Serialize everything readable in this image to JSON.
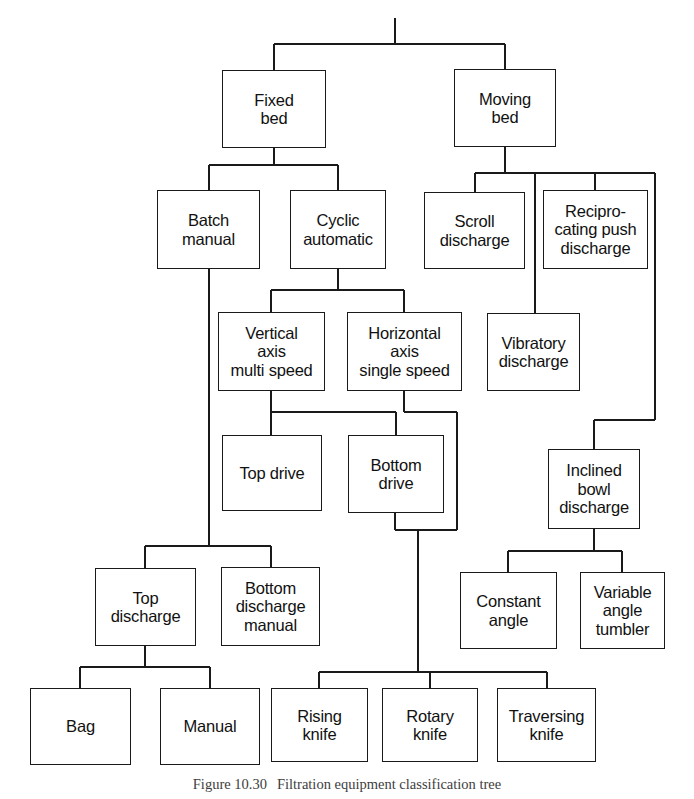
{
  "figure": {
    "type": "classification-tree-diagram",
    "title": "Filtration equipment classification tree",
    "caption_number": "Figure 10.30",
    "caption_text": "Filtration equipment classification tree",
    "background_color": "#ffffff",
    "line_color": "#1a1a1a",
    "box_border_color": "#1a1a1a",
    "box_fill_color": "#ffffff",
    "text_color": "#111111"
  },
  "nodes": [
    {
      "id": "fixed-bed",
      "label": "Fixed\nbed",
      "level": 1,
      "x": 222,
      "y": 70,
      "w": 104,
      "h": 78
    },
    {
      "id": "moving-bed",
      "label": "Moving\nbed",
      "level": 1,
      "x": 454,
      "y": 69,
      "w": 102,
      "h": 78
    },
    {
      "id": "batch-manual",
      "label": "Batch\nmanual",
      "level": 2,
      "x": 157,
      "y": 190,
      "w": 103,
      "h": 79
    },
    {
      "id": "cyclic-automatic",
      "label": "Cyclic\nautomatic",
      "level": 2,
      "x": 290,
      "y": 190,
      "w": 96,
      "h": 79
    },
    {
      "id": "scroll-discharge",
      "label": "Scroll\ndischarge",
      "level": 2,
      "x": 424,
      "y": 192,
      "w": 101,
      "h": 77
    },
    {
      "id": "reciprocating-push",
      "label": "Recipro-\ncating push\ndischarge",
      "level": 2,
      "x": 543,
      "y": 190,
      "w": 105,
      "h": 79
    },
    {
      "id": "vertical-axis",
      "label": "Vertical\naxis\nmulti speed",
      "level": 3,
      "x": 218,
      "y": 312,
      "w": 107,
      "h": 79
    },
    {
      "id": "horizontal-axis",
      "label": "Horizontal\naxis\nsingle speed",
      "level": 3,
      "x": 347,
      "y": 312,
      "w": 115,
      "h": 79
    },
    {
      "id": "vibratory-discharge",
      "label": "Vibratory\ndischarge",
      "level": 3,
      "x": 487,
      "y": 313,
      "w": 93,
      "h": 78
    },
    {
      "id": "top-drive",
      "label": "Top drive",
      "level": 4,
      "x": 222,
      "y": 435,
      "w": 100,
      "h": 76
    },
    {
      "id": "bottom-drive",
      "label": "Bottom\ndrive",
      "level": 4,
      "x": 348,
      "y": 435,
      "w": 96,
      "h": 78
    },
    {
      "id": "inclined-bowl",
      "label": "Inclined\nbowl\ndischarge",
      "level": 4,
      "x": 548,
      "y": 449,
      "w": 92,
      "h": 80
    },
    {
      "id": "top-discharge",
      "label": "Top\ndischarge",
      "level": 5,
      "x": 95,
      "y": 568,
      "w": 101,
      "h": 78
    },
    {
      "id": "bottom-discharge-manual",
      "label": "Bottom\ndischarge\nmanual",
      "level": 5,
      "x": 221,
      "y": 567,
      "w": 99,
      "h": 79
    },
    {
      "id": "constant-angle",
      "label": "Constant\nangle",
      "level": 5,
      "x": 460,
      "y": 572,
      "w": 97,
      "h": 77
    },
    {
      "id": "variable-angle-tumbler",
      "label": "Variable\nangle\ntumbler",
      "level": 5,
      "x": 580,
      "y": 572,
      "w": 85,
      "h": 77
    },
    {
      "id": "bag",
      "label": "Bag",
      "level": 6,
      "x": 30,
      "y": 688,
      "w": 101,
      "h": 77
    },
    {
      "id": "manual",
      "label": "Manual",
      "level": 6,
      "x": 160,
      "y": 688,
      "w": 100,
      "h": 77
    },
    {
      "id": "rising-knife",
      "label": "Rising\nknife",
      "level": 6,
      "x": 271,
      "y": 688,
      "w": 97,
      "h": 74
    },
    {
      "id": "rotary-knife",
      "label": "Rotary\nknife",
      "level": 6,
      "x": 382,
      "y": 688,
      "w": 96,
      "h": 74
    },
    {
      "id": "traversing-knife",
      "label": "Traversing\nknife",
      "level": 6,
      "x": 497,
      "y": 688,
      "w": 99,
      "h": 74
    }
  ],
  "edges": [
    {
      "id": "root-stem",
      "from": "root",
      "to": "split-1",
      "path": "M 395 18 L 395 44"
    },
    {
      "id": "root-to-fixed",
      "from": "root",
      "to": "fixed-bed",
      "path": "M 274 44 L 505 44 M 274 44 L 274 70 M 505 44 L 505 69"
    },
    {
      "id": "fixed-to-children",
      "from": "fixed-bed",
      "to": "batch-cyclic",
      "path": "M 274 148 L 274 165 M 209 165 L 338 165 M 209 165 L 209 190 M 338 165 L 338 190"
    },
    {
      "id": "moving-to-children",
      "from": "moving-bed",
      "to": "moving-children",
      "path": "M 505 147 L 505 173 M 475 173 L 655 173 M 475 173 L 475 192 M 595 173 L 595 190 M 535 173 L 535 313 M 655 173 L 655 420"
    },
    {
      "id": "cyclic-to-children",
      "from": "cyclic-automatic",
      "to": "axis-nodes",
      "path": "M 338 269 L 338 290 M 271 290 L 404 290 M 271 290 L 271 312 M 404 290 L 404 312"
    },
    {
      "id": "batch-long-drop",
      "from": "batch-manual",
      "to": "discharge-bus",
      "path": "M 209 269 L 209 546"
    },
    {
      "id": "vertical-to-drives",
      "from": "vertical-axis",
      "to": "drives",
      "path": "M 271 391 L 271 412 M 271 412 L 396 412 M 271 412 L 271 435"
    },
    {
      "id": "horizontal-to-bottom",
      "from": "horizontal-axis",
      "to": "bottom-drive",
      "path": "M 404 391 L 404 412 M 404 412 L 457 412 M 457 412 L 457 530 M 396 412 L 396 435"
    },
    {
      "id": "moving-vibratory",
      "from": "moving-bed-bus",
      "to": "vibratory-discharge",
      "path": "M 535 313 L 535 313"
    },
    {
      "id": "recip-to-inclined",
      "from": "reciprocating-push",
      "to": "inclined-bowl",
      "path": "M 655 420 L 594 420 M 594 420 L 594 449"
    },
    {
      "id": "bottom-drive-drop",
      "from": "bottom-drive",
      "to": "knives-bus",
      "path": "M 395 513 L 395 530 M 395 530 L 457 530 M 418 530 L 418 672"
    },
    {
      "id": "discharge-bus",
      "from": "batch-manual",
      "to": "top-bottom-discharge",
      "path": "M 145 546 L 271 546 M 145 546 L 145 568 M 271 546 L 271 567"
    },
    {
      "id": "inclined-to-angles",
      "from": "inclined-bowl",
      "to": "angle-nodes",
      "path": "M 594 529 L 594 551 M 508 551 L 622 551 M 508 551 L 508 572 M 622 551 L 622 572"
    },
    {
      "id": "topdisch-to-bagmanual",
      "from": "top-discharge",
      "to": "bag-manual",
      "path": "M 145 646 L 145 667 M 80 667 L 210 667 M 80 667 L 80 688 M 210 667 L 210 688"
    },
    {
      "id": "knives-bus",
      "from": "bottom-drive",
      "to": "knife-nodes",
      "path": "M 319 672 L 547 672 M 319 672 L 319 688 M 430 672 L 430 688 M 547 672 L 547 688"
    }
  ],
  "levels": [
    {
      "level": 1,
      "name": "bed-type"
    },
    {
      "level": 2,
      "name": "operation-mode"
    },
    {
      "level": 3,
      "name": "axis-and-discharge"
    },
    {
      "level": 4,
      "name": "drive-type"
    },
    {
      "level": 5,
      "name": "discharge-method"
    },
    {
      "level": 6,
      "name": "discharge-device"
    }
  ]
}
